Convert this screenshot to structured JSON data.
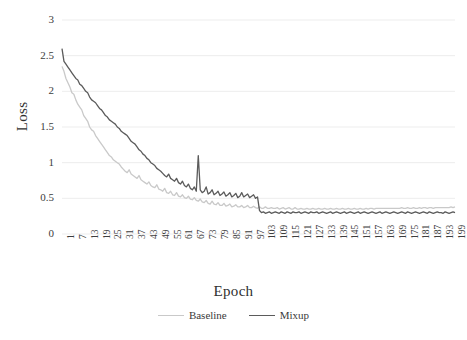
{
  "chart_data": {
    "type": "line",
    "title": "",
    "xlabel": "Epoch",
    "ylabel": "Loss",
    "ylim": [
      0,
      3
    ],
    "xlim": [
      1,
      200
    ],
    "grid": true,
    "grid_axis": "y",
    "legend_position": "bottom",
    "yticks": [
      "0",
      "0.5",
      "1",
      "1.5",
      "2",
      "2.5",
      "3"
    ],
    "ytick_values": [
      0,
      0.5,
      1,
      1.5,
      2,
      2.5,
      3
    ],
    "xticks": [
      "1",
      "7",
      "13",
      "19",
      "25",
      "31",
      "37",
      "43",
      "49",
      "55",
      "61",
      "67",
      "73",
      "79",
      "85",
      "91",
      "97",
      "103",
      "109",
      "115",
      "121",
      "127",
      "133",
      "139",
      "145",
      "151",
      "157",
      "163",
      "169",
      "175",
      "181",
      "187",
      "193",
      "199"
    ],
    "xtick_step": 6,
    "colors": {
      "baseline": "#c9c9c9",
      "mixup": "#5b5b5b",
      "grid": "#ededed",
      "text": "#3a3a3a"
    },
    "series": [
      {
        "name": "Baseline",
        "color": "#c9c9c9",
        "values": [
          2.35,
          2.28,
          2.18,
          2.12,
          2.06,
          1.98,
          1.96,
          1.88,
          1.82,
          1.78,
          1.74,
          1.66,
          1.62,
          1.58,
          1.5,
          1.46,
          1.44,
          1.38,
          1.34,
          1.3,
          1.26,
          1.22,
          1.18,
          1.14,
          1.1,
          1.08,
          1.04,
          1.02,
          1.0,
          0.98,
          0.94,
          0.91,
          0.88,
          0.86,
          0.9,
          0.84,
          0.82,
          0.8,
          0.78,
          0.82,
          0.76,
          0.74,
          0.72,
          0.7,
          0.73,
          0.68,
          0.66,
          0.65,
          0.69,
          0.63,
          0.62,
          0.6,
          0.64,
          0.58,
          0.57,
          0.6,
          0.55,
          0.54,
          0.58,
          0.53,
          0.52,
          0.55,
          0.51,
          0.5,
          0.53,
          0.49,
          0.48,
          0.51,
          0.47,
          0.46,
          0.49,
          0.45,
          0.44,
          0.47,
          0.43,
          0.42,
          0.46,
          0.42,
          0.41,
          0.44,
          0.4,
          0.4,
          0.43,
          0.39,
          0.4,
          0.42,
          0.38,
          0.39,
          0.41,
          0.38,
          0.38,
          0.4,
          0.37,
          0.38,
          0.4,
          0.37,
          0.37,
          0.39,
          0.37,
          0.36,
          0.38,
          0.36,
          0.36,
          0.38,
          0.36,
          0.36,
          0.37,
          0.36,
          0.36,
          0.37,
          0.35,
          0.36,
          0.37,
          0.35,
          0.36,
          0.37,
          0.35,
          0.35,
          0.37,
          0.35,
          0.35,
          0.36,
          0.35,
          0.35,
          0.36,
          0.35,
          0.35,
          0.36,
          0.35,
          0.35,
          0.36,
          0.35,
          0.35,
          0.36,
          0.35,
          0.35,
          0.36,
          0.35,
          0.35,
          0.36,
          0.35,
          0.35,
          0.36,
          0.35,
          0.35,
          0.36,
          0.35,
          0.35,
          0.36,
          0.35,
          0.35,
          0.36,
          0.35,
          0.35,
          0.36,
          0.35,
          0.36,
          0.36,
          0.35,
          0.36,
          0.36,
          0.36,
          0.36,
          0.36,
          0.36,
          0.36,
          0.36,
          0.36,
          0.36,
          0.36,
          0.36,
          0.36,
          0.37,
          0.36,
          0.36,
          0.37,
          0.36,
          0.36,
          0.37,
          0.36,
          0.36,
          0.37,
          0.36,
          0.37,
          0.37,
          0.36,
          0.37,
          0.37,
          0.36,
          0.37,
          0.37,
          0.37,
          0.37,
          0.37,
          0.37,
          0.37,
          0.37,
          0.38,
          0.37,
          0.38
        ]
      },
      {
        "name": "Mixup",
        "color": "#5b5b5b",
        "values": [
          2.6,
          2.42,
          2.38,
          2.34,
          2.3,
          2.26,
          2.22,
          2.18,
          2.16,
          2.1,
          2.08,
          2.04,
          2.0,
          1.98,
          1.92,
          1.88,
          1.86,
          1.84,
          1.8,
          1.76,
          1.74,
          1.7,
          1.66,
          1.64,
          1.6,
          1.58,
          1.56,
          1.54,
          1.5,
          1.48,
          1.44,
          1.42,
          1.4,
          1.38,
          1.34,
          1.3,
          1.28,
          1.26,
          1.22,
          1.18,
          1.16,
          1.12,
          1.1,
          1.06,
          1.04,
          1.0,
          0.98,
          0.96,
          0.92,
          0.9,
          0.88,
          0.85,
          0.82,
          0.8,
          0.84,
          0.78,
          0.76,
          0.74,
          0.78,
          0.72,
          0.7,
          0.74,
          0.68,
          0.66,
          0.7,
          0.64,
          0.62,
          0.66,
          0.6,
          1.1,
          0.62,
          0.58,
          0.6,
          0.66,
          0.56,
          0.58,
          0.62,
          0.55,
          0.57,
          0.6,
          0.54,
          0.56,
          0.59,
          0.53,
          0.55,
          0.58,
          0.52,
          0.54,
          0.57,
          0.51,
          0.53,
          0.58,
          0.52,
          0.54,
          0.56,
          0.51,
          0.53,
          0.55,
          0.5,
          0.52,
          0.33,
          0.3,
          0.31,
          0.29,
          0.3,
          0.31,
          0.29,
          0.3,
          0.31,
          0.3,
          0.29,
          0.31,
          0.3,
          0.29,
          0.31,
          0.3,
          0.29,
          0.31,
          0.3,
          0.3,
          0.31,
          0.29,
          0.3,
          0.31,
          0.3,
          0.29,
          0.31,
          0.3,
          0.3,
          0.31,
          0.29,
          0.3,
          0.31,
          0.3,
          0.29,
          0.3,
          0.31,
          0.29,
          0.3,
          0.31,
          0.3,
          0.29,
          0.3,
          0.31,
          0.29,
          0.3,
          0.31,
          0.3,
          0.29,
          0.3,
          0.31,
          0.29,
          0.3,
          0.31,
          0.3,
          0.29,
          0.3,
          0.31,
          0.3,
          0.29,
          0.3,
          0.31,
          0.29,
          0.3,
          0.31,
          0.3,
          0.29,
          0.3,
          0.31,
          0.3,
          0.29,
          0.3,
          0.31,
          0.3,
          0.29,
          0.31,
          0.3,
          0.29,
          0.3,
          0.31,
          0.3,
          0.29,
          0.3,
          0.31,
          0.3,
          0.29,
          0.31,
          0.3,
          0.29,
          0.3,
          0.31,
          0.3,
          0.3,
          0.29,
          0.31,
          0.3,
          0.29,
          0.3,
          0.31,
          0.3
        ]
      }
    ]
  },
  "legend": {
    "entries": [
      {
        "label": "Baseline",
        "color": "#c9c9c9"
      },
      {
        "label": "Mixup",
        "color": "#5b5b5b"
      }
    ]
  },
  "axes": {
    "x_title": "Epoch",
    "y_title": "Loss"
  }
}
